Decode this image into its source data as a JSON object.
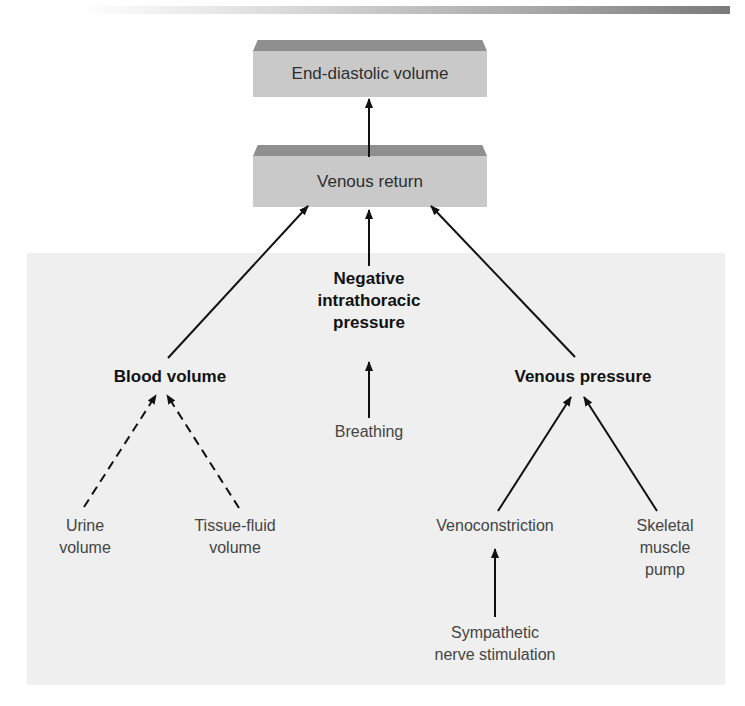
{
  "decor": {
    "top_bar": "gradient-bar"
  },
  "boxes": {
    "end_diastolic": {
      "label": "End-diastolic volume"
    },
    "venous_return": {
      "label": "Venous return"
    }
  },
  "nodes": {
    "negative_intrathoracic": {
      "line1": "Negative",
      "line2": "intrathoracic",
      "line3": "pressure"
    },
    "blood_volume": {
      "label": "Blood volume"
    },
    "venous_pressure": {
      "label": "Venous pressure"
    },
    "breathing": {
      "label": "Breathing"
    },
    "urine_volume": {
      "line1": "Urine",
      "line2": "volume"
    },
    "tissue_fluid_volume": {
      "line1": "Tissue-fluid",
      "line2": "volume"
    },
    "venoconstriction": {
      "label": "Venoconstriction"
    },
    "skeletal_muscle_pump": {
      "line1": "Skeletal",
      "line2": "muscle",
      "line3": "pump"
    },
    "sympathetic": {
      "line1": "Sympathetic",
      "line2": "nerve stimulation"
    }
  },
  "edges": [
    {
      "from": "Venous return",
      "to": "End-diastolic volume",
      "style": "solid"
    },
    {
      "from": "Blood volume",
      "to": "Venous return",
      "style": "solid"
    },
    {
      "from": "Negative intrathoracic pressure",
      "to": "Venous return",
      "style": "solid"
    },
    {
      "from": "Venous pressure",
      "to": "Venous return",
      "style": "solid"
    },
    {
      "from": "Breathing",
      "to": "Negative intrathoracic pressure",
      "style": "solid"
    },
    {
      "from": "Urine volume",
      "to": "Blood volume",
      "style": "dashed"
    },
    {
      "from": "Tissue-fluid volume",
      "to": "Blood volume",
      "style": "dashed"
    },
    {
      "from": "Venoconstriction",
      "to": "Venous pressure",
      "style": "solid"
    },
    {
      "from": "Skeletal muscle pump",
      "to": "Venous pressure",
      "style": "solid"
    },
    {
      "from": "Sympathetic nerve stimulation",
      "to": "Venoconstriction",
      "style": "solid"
    }
  ],
  "colors": {
    "box_face": "#c9c9c9",
    "box_bevel": "#8f8f8f",
    "panel": "#efefef",
    "line": "#111111"
  }
}
